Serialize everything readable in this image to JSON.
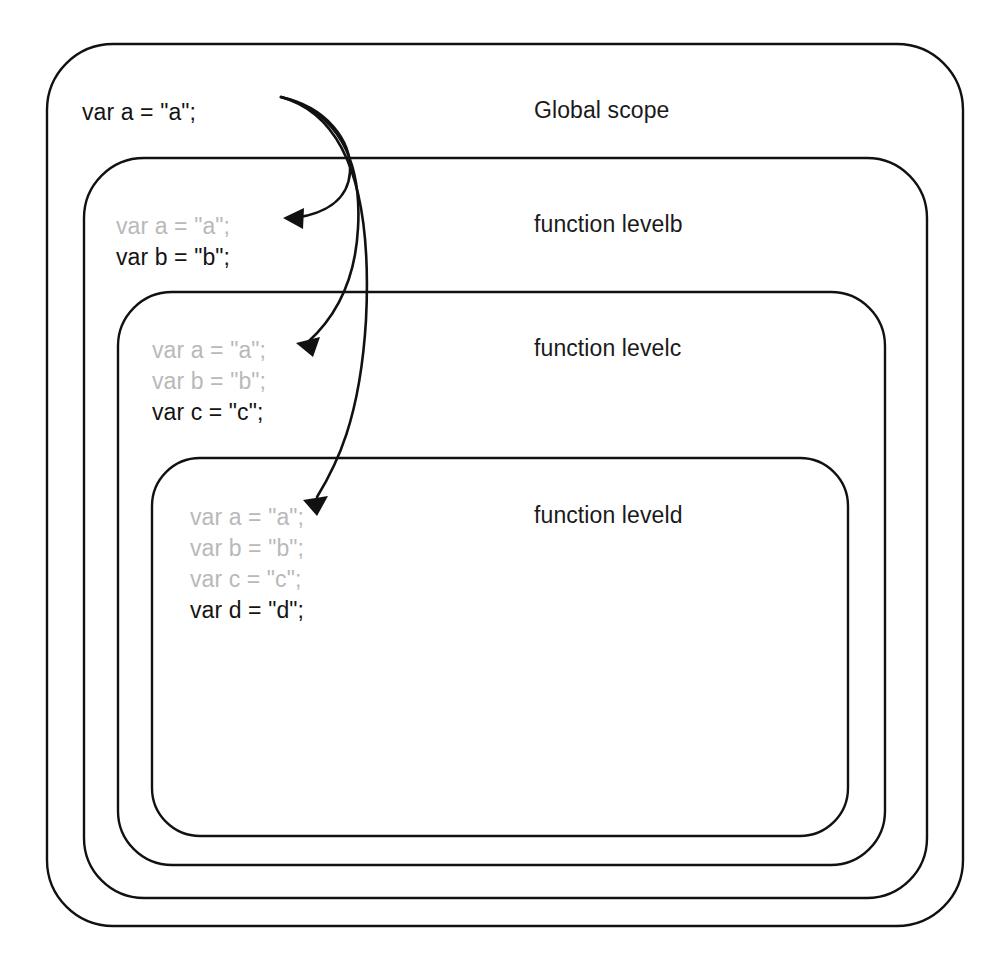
{
  "diagram": {
    "type": "nested-scope-diagram",
    "colors": {
      "border": "#111111",
      "declared_text": "#141414",
      "inherited_text": "#b9b9b9",
      "background": "#ffffff",
      "arrow": "#111111"
    },
    "scopes": [
      {
        "id": "global",
        "label": "Global scope",
        "depth": 0,
        "code": [
          {
            "text": "var a = \"a\";",
            "state": "declared"
          }
        ]
      },
      {
        "id": "levelb",
        "label": "function levelb",
        "depth": 1,
        "code": [
          {
            "text": "var a = \"a\";",
            "state": "inherited"
          },
          {
            "text": "var b = \"b\";",
            "state": "declared"
          }
        ]
      },
      {
        "id": "levelc",
        "label": "function levelc",
        "depth": 2,
        "code": [
          {
            "text": "var a = \"a\";",
            "state": "inherited"
          },
          {
            "text": "var b = \"b\";",
            "state": "inherited"
          },
          {
            "text": "var c = \"c\";",
            "state": "declared"
          }
        ]
      },
      {
        "id": "leveld",
        "label": "function leveld",
        "depth": 3,
        "code": [
          {
            "text": "var a = \"a\";",
            "state": "inherited"
          },
          {
            "text": "var b = \"b\";",
            "state": "inherited"
          },
          {
            "text": "var c = \"c\";",
            "state": "inherited"
          },
          {
            "text": "var d = \"d\";",
            "state": "declared"
          }
        ]
      }
    ],
    "arrows": [
      {
        "id": "global-to-levelb",
        "from": "global.var-a",
        "to": "levelb.var-a"
      },
      {
        "id": "global-to-levelc",
        "from": "global.var-a",
        "to": "levelc.var-a"
      },
      {
        "id": "global-to-leveld",
        "from": "global.var-a",
        "to": "leveld.var-a"
      }
    ]
  }
}
